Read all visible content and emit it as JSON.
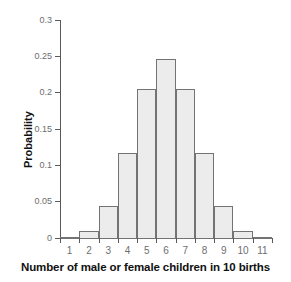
{
  "chart_data": {
    "type": "bar",
    "title": "",
    "subtitle": "",
    "xlabel": "Number of male or female children in 10 births",
    "ylabel": "Probability",
    "categories": [
      "1",
      "2",
      "3",
      "4",
      "5",
      "6",
      "7",
      "8",
      "9",
      "10",
      "11"
    ],
    "values": [
      0.001,
      0.01,
      0.044,
      0.117,
      0.205,
      0.246,
      0.205,
      0.117,
      0.044,
      0.01,
      0.001
    ],
    "xlim": [
      0.5,
      11.5
    ],
    "ylim": [
      0,
      0.3
    ],
    "ytick_labels": [
      "0",
      "0.05",
      "0.1",
      "0.15",
      "0.2",
      "0.25",
      "0.3"
    ],
    "ytick_values": [
      0,
      0.05,
      0.1,
      0.15,
      0.2,
      0.25,
      0.3
    ],
    "xtick_labels": [
      "1",
      "2",
      "3",
      "4",
      "5",
      "6",
      "7",
      "8",
      "9",
      "10",
      "11"
    ],
    "grid": false,
    "legend": null,
    "bar_fill_color": "#ececec",
    "bar_border_color": "#737373",
    "axis_color": "#5a5a5a",
    "tick_label_color": "#6e6e6e",
    "axis_title_color": "#111111",
    "background_color": "#ffffff"
  }
}
